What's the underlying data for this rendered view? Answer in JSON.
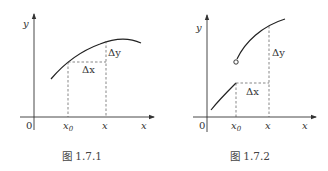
{
  "figures": [
    {
      "caption": "图 1.7.1",
      "axis_labels": {
        "x": "x",
        "y": "y",
        "origin": "0"
      },
      "ticks": [
        {
          "main": "x",
          "sub": "0"
        },
        {
          "main": "x",
          "sub": ""
        }
      ],
      "annotations": {
        "delta_x": "Δx",
        "delta_y": "Δy"
      },
      "description": "continuous concave curve; increment Δx from x0 to x, and Δy between function values"
    },
    {
      "caption": "图 1.7.2",
      "axis_labels": {
        "x": "x",
        "y": "y",
        "origin": "0"
      },
      "ticks": [
        {
          "main": "x",
          "sub": "0"
        },
        {
          "main": "x",
          "sub": ""
        }
      ],
      "annotations": {
        "delta_x": "Δx",
        "delta_y": "Δy"
      },
      "description": "function with jump discontinuity at x0; open circle marks upper branch start"
    }
  ]
}
